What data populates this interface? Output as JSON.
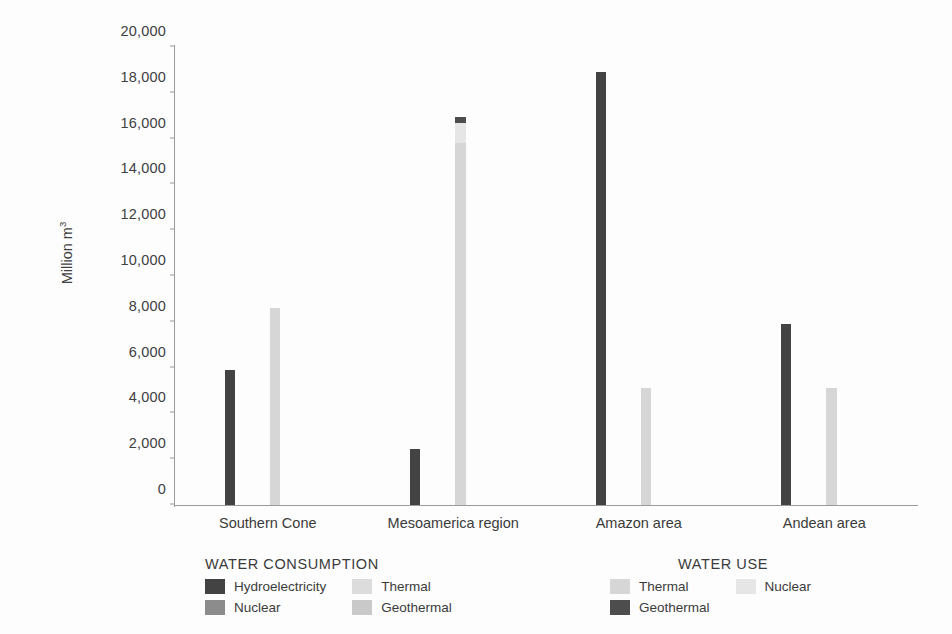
{
  "chart_data": {
    "type": "bar",
    "title": "",
    "subtitle": "",
    "xlabel": "",
    "ylabel": "Million m3",
    "ylabel_base": "Million m",
    "ylabel_sup": "3",
    "ylim": [
      0,
      20000
    ],
    "ytick_step": 2000,
    "yticks": [
      "0",
      "2,000",
      "4,000",
      "6,000",
      "8,000",
      "10,000",
      "12,000",
      "14,000",
      "16,000",
      "18,000",
      "20,000"
    ],
    "ytick_values": [
      0,
      2000,
      4000,
      6000,
      8000,
      10000,
      12000,
      14000,
      16000,
      18000,
      20000
    ],
    "grid": false,
    "legend_position": "bottom",
    "categories": [
      "Southern Cone",
      "Mesoamerica region",
      "Amazon area",
      "Andean area"
    ],
    "series": [
      {
        "name": "Hydroelectricity",
        "group": "WATER CONSUMPTION",
        "color": "#434343",
        "values": [
          5900,
          2450,
          18900,
          7900
        ]
      },
      {
        "name": "Nuclear",
        "group": "WATER CONSUMPTION",
        "color": "#8c8c8c",
        "values": [
          0,
          0,
          0,
          0
        ]
      },
      {
        "name": "Thermal",
        "group": "WATER CONSUMPTION",
        "color": "#dcdcdc",
        "values": [
          0,
          0,
          0,
          0
        ]
      },
      {
        "name": "Geothermal",
        "group": "WATER CONSUMPTION",
        "color": "#c9c9c9",
        "values": [
          0,
          0,
          0,
          0
        ]
      },
      {
        "name": "Thermal",
        "group": "WATER USE",
        "color": "#d6d6d6",
        "values": [
          8600,
          15800,
          5100,
          5100
        ]
      },
      {
        "name": "Nuclear",
        "group": "WATER USE",
        "color": "#e6e6e6",
        "values": [
          0,
          900,
          0,
          0
        ]
      },
      {
        "name": "Geothermal",
        "group": "WATER USE",
        "color": "#4d4d4d",
        "values": [
          0,
          250,
          0,
          0
        ]
      }
    ]
  },
  "legends": [
    {
      "title": "WATER CONSUMPTION",
      "items": [
        {
          "label": "Hydroelectricity",
          "color": "#434343"
        },
        {
          "label": "Thermal",
          "color": "#dcdcdc"
        },
        {
          "label": "Nuclear",
          "color": "#8c8c8c"
        },
        {
          "label": "Geothermal",
          "color": "#c9c9c9"
        }
      ]
    },
    {
      "title": "WATER USE",
      "items": [
        {
          "label": "Thermal",
          "color": "#d6d6d6"
        },
        {
          "label": "Nuclear",
          "color": "#e6e6e6"
        },
        {
          "label": "Geothermal",
          "color": "#4d4d4d"
        }
      ]
    }
  ],
  "axis": {
    "line_color": "#9a9a9a"
  }
}
